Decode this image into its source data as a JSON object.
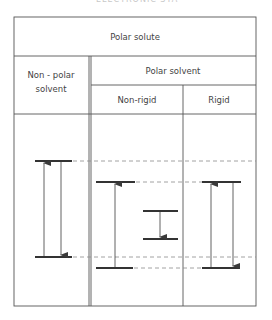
{
  "caption": "ELECTRONIC STATES",
  "table": {
    "header_top": "Polar solute",
    "col_nonpolar_line1": "Non - polar",
    "col_nonpolar_line2": "solvent",
    "col_polar": "Polar solvent",
    "col_nonrigid": "Non-rigid",
    "col_rigid": "Rigid"
  },
  "diagram": {
    "line_color": "#3a3a3a",
    "dash_color": "#8a8a8a",
    "columns": [
      {
        "name": "non-polar-solvent",
        "upper_level_y": 161,
        "lower_level_y": 257,
        "arrows": [
          "absorption-up",
          "emission-down"
        ]
      },
      {
        "name": "polar-non-rigid",
        "upper_level_y": 182,
        "lower_level_y": 268,
        "relaxed_upper_y": 211,
        "relaxed_lower_y": 239,
        "arrows": [
          "absorption-up",
          "emission-down-relaxed"
        ]
      },
      {
        "name": "polar-rigid",
        "upper_level_y": 182,
        "lower_level_y": 268,
        "arrows": [
          "absorption-up",
          "emission-down"
        ]
      }
    ]
  }
}
